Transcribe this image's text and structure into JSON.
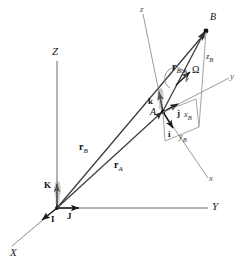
{
  "figure": {
    "type": "kinematics-reference-frame-diagram",
    "background": "#ffffff",
    "line_color": "#3a3a3a",
    "light_line_color": "#9a9a9a",
    "text_color": "#111111"
  },
  "fixed_frame": {
    "origin_label": "O",
    "axes": [
      {
        "name": "X",
        "label": "X",
        "kind": "major"
      },
      {
        "name": "Y",
        "label": "Y",
        "kind": "major"
      },
      {
        "name": "Z",
        "label": "Z",
        "kind": "major"
      }
    ],
    "unit_vectors": [
      {
        "name": "I",
        "label": "I",
        "axis": "X"
      },
      {
        "name": "J",
        "label": "J",
        "axis": "Y"
      },
      {
        "name": "K",
        "label": "K",
        "axis": "Z"
      }
    ]
  },
  "moving_frame": {
    "attached_at": "A",
    "origin_label": "A",
    "axes": [
      {
        "name": "x",
        "label": "x",
        "kind": "minor"
      },
      {
        "name": "y",
        "label": "y",
        "kind": "minor"
      },
      {
        "name": "z",
        "label": "z",
        "kind": "minor"
      }
    ],
    "unit_vectors": [
      {
        "name": "i",
        "label": "i",
        "axis": "x"
      },
      {
        "name": "j",
        "label": "j",
        "axis": "y"
      },
      {
        "name": "k",
        "label": "k",
        "axis": "z"
      }
    ],
    "angular_velocity": {
      "symbol": "Ω",
      "label": "Ω"
    }
  },
  "points": [
    {
      "name": "A",
      "label": "A"
    },
    {
      "name": "B",
      "label": "B"
    }
  ],
  "vectors": [
    {
      "name": "r_A",
      "symbol": "r",
      "subscript": "A",
      "from": "O",
      "to": "A"
    },
    {
      "name": "r_B",
      "symbol": "r",
      "subscript": "B",
      "from": "O",
      "to": "B"
    },
    {
      "name": "r_B/A",
      "symbol": "r",
      "subscript": "B/A",
      "from": "A",
      "to": "B"
    }
  ],
  "components": [
    {
      "name": "x_B",
      "symbol": "x",
      "subscript": "B"
    },
    {
      "name": "y_B",
      "symbol": "y",
      "subscript": "B"
    },
    {
      "name": "z_B",
      "symbol": "z",
      "subscript": "B"
    }
  ]
}
